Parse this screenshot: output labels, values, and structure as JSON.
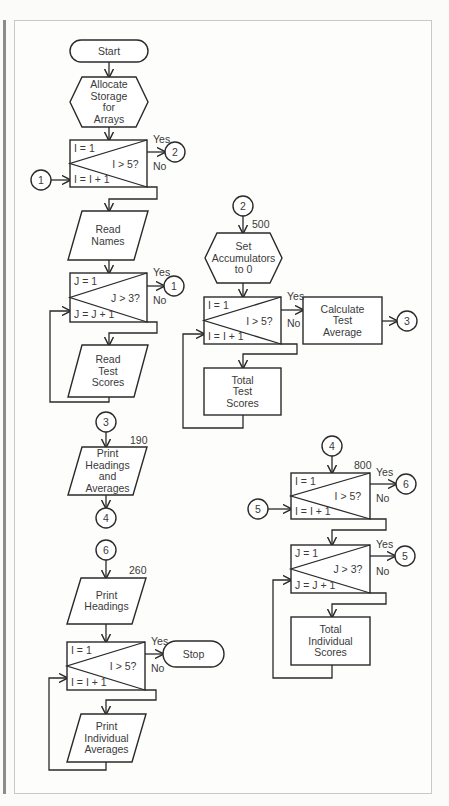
{
  "diagram": {
    "terminals": [
      {
        "id": "start",
        "label": "Start",
        "x": 70,
        "y": 40,
        "w": 78,
        "h": 22
      },
      {
        "id": "stop",
        "label": "Stop",
        "x": 163,
        "y": 641,
        "w": 61,
        "h": 26
      }
    ],
    "preparations": [
      {
        "id": "allocate",
        "lines": [
          "Allocate",
          "Storage",
          "for",
          "Arrays"
        ],
        "x": 70,
        "y": 77,
        "w": 78,
        "h": 50
      },
      {
        "id": "set-accumulators",
        "lines": [
          "Set",
          "Accumulators",
          "to 0"
        ],
        "x": 205,
        "y": 233,
        "w": 77,
        "h": 50
      }
    ],
    "io": [
      {
        "id": "read-names",
        "lines": [
          "Read",
          "Names"
        ],
        "x": 68,
        "y": 211,
        "w": 80,
        "h": 49
      },
      {
        "id": "read-test-scores",
        "lines": [
          "Read",
          "Test",
          "Scores"
        ],
        "x": 68,
        "y": 345,
        "w": 80,
        "h": 52
      },
      {
        "id": "print-headings-averages",
        "lines": [
          "Print",
          "Headings",
          "and",
          "Averages"
        ],
        "x": 68,
        "y": 447,
        "w": 79,
        "h": 48
      },
      {
        "id": "print-headings",
        "lines": [
          "Print",
          "Headings"
        ],
        "x": 67,
        "y": 578,
        "w": 79,
        "h": 46
      },
      {
        "id": "print-individual-averages",
        "lines": [
          "Print",
          "Individual",
          "Averages"
        ],
        "x": 67,
        "y": 714,
        "w": 79,
        "h": 48
      }
    ],
    "processes": [
      {
        "id": "calculate-test-average",
        "lines": [
          "Calculate",
          "Test",
          "Average"
        ],
        "x": 303,
        "y": 297,
        "w": 79,
        "h": 47
      },
      {
        "id": "total-test-scores",
        "lines": [
          "Total",
          "Test",
          "Scores"
        ],
        "x": 204,
        "y": 368,
        "w": 77,
        "h": 47
      },
      {
        "id": "total-individual-scores",
        "lines": [
          "Total",
          "Individual",
          "Scores"
        ],
        "x": 291,
        "y": 617,
        "w": 79,
        "h": 48
      }
    ],
    "loops": [
      {
        "id": "loop-i-1",
        "init": "I = 1",
        "test": "I > 5?",
        "incr": "I = I + 1",
        "yes": "Yes",
        "no": "No",
        "x": 70,
        "y": 140,
        "w": 77,
        "h": 47
      },
      {
        "id": "loop-j-1",
        "init": "J = 1",
        "test": "J > 3?",
        "incr": "J = J + 1",
        "yes": "Yes",
        "no": "No",
        "x": 70,
        "y": 273,
        "w": 77,
        "h": 49
      },
      {
        "id": "loop-i-2",
        "init": "I = 1",
        "test": "I > 5?",
        "incr": "I = I + 1",
        "yes": "Yes",
        "no": "No",
        "x": 204,
        "y": 297,
        "w": 77,
        "h": 47
      },
      {
        "id": "loop-i-3",
        "init": "I = 1",
        "test": "I > 5?",
        "incr": "I = I + 1",
        "yes": "Yes",
        "no": "No",
        "x": 291,
        "y": 473,
        "w": 79,
        "h": 46
      },
      {
        "id": "loop-j-2",
        "init": "J = 1",
        "test": "J > 3?",
        "incr": "J = J + 1",
        "yes": "Yes",
        "no": "No",
        "x": 291,
        "y": 545,
        "w": 79,
        "h": 48
      },
      {
        "id": "loop-i-4",
        "init": "I = 1",
        "test": "I > 5?",
        "incr": "I = I + 1",
        "yes": "Yes",
        "no": "No",
        "x": 67,
        "y": 642,
        "w": 78,
        "h": 48
      }
    ],
    "connectors": [
      {
        "label": "1",
        "cx": 41,
        "cy": 180
      },
      {
        "label": "2",
        "cx": 175,
        "cy": 152
      },
      {
        "label": "1",
        "cx": 174,
        "cy": 286
      },
      {
        "label": "2",
        "cx": 243,
        "cy": 206
      },
      {
        "label": "3",
        "cx": 407,
        "cy": 321
      },
      {
        "label": "3",
        "cx": 106,
        "cy": 422
      },
      {
        "label": "4",
        "cx": 106,
        "cy": 518
      },
      {
        "label": "6",
        "cx": 106,
        "cy": 550
      },
      {
        "label": "4",
        "cx": 332,
        "cy": 446
      },
      {
        "label": "6",
        "cx": 406,
        "cy": 484
      },
      {
        "label": "5",
        "cx": 258,
        "cy": 509
      },
      {
        "label": "5",
        "cx": 405,
        "cy": 556
      }
    ],
    "line_numbers": [
      {
        "label": "500",
        "x": 252,
        "y": 228
      },
      {
        "label": "190",
        "x": 130,
        "y": 444
      },
      {
        "label": "260",
        "x": 129,
        "y": 574
      },
      {
        "label": "800",
        "x": 354,
        "y": 469
      }
    ]
  }
}
